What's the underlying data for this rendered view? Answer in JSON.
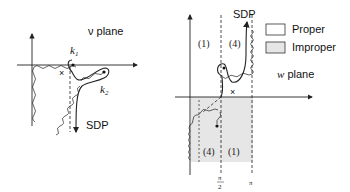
{
  "left_panel": {
    "plane_label": "ν plane",
    "k1_label": "k",
    "k1_sub": "1",
    "k2_label": "k",
    "k2_sub": "2",
    "sdp_label": "SDP",
    "cross": "×"
  },
  "right_panel": {
    "plane_label_var": "w",
    "plane_label_word": " plane",
    "sdp_label": "SDP",
    "region_top_left": "(1)",
    "region_top_right": "(4)",
    "region_bottom_left": "(4)",
    "region_bottom_right": "(1)",
    "tick_pi_half_num": "π",
    "tick_pi_half_den": "2",
    "tick_pi": "π",
    "cross": "×"
  },
  "legend": {
    "items": [
      {
        "label": "Proper",
        "color": "#ffffff"
      },
      {
        "label": "Improper",
        "color": "#e6e6e6"
      }
    ]
  },
  "colors": {
    "line": "#222222",
    "shade": "#e6e6e6"
  }
}
